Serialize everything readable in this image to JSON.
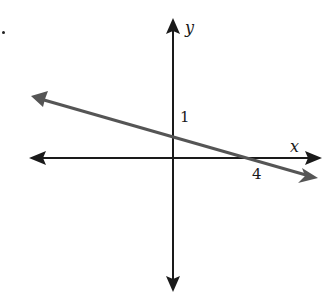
{
  "figure": {
    "marker": ".",
    "axes": {
      "x_label": "x",
      "y_label": "y",
      "axis_color": "#1a1a1a"
    },
    "line": {
      "color": "#555555",
      "y_intercept_label": "1",
      "x_intercept_label": "4"
    }
  }
}
